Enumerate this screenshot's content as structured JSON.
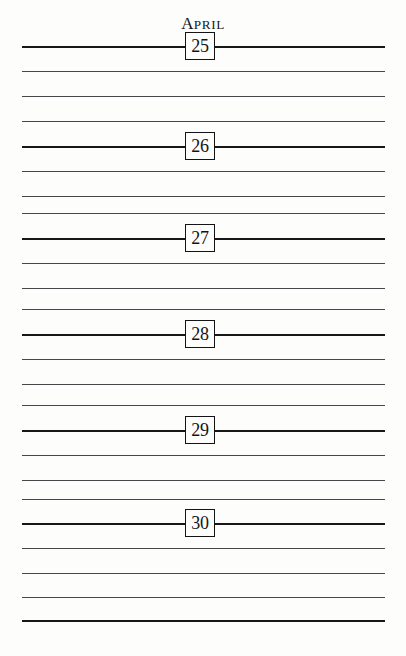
{
  "page": {
    "kind": "printed-diary-page",
    "width": 406,
    "height": 656,
    "background_color": "#fdfdfc",
    "ink_color": "#18181b"
  },
  "header": {
    "month_label": "APRIL",
    "month_first_letter": "A",
    "month_rest_letters": "PRIL",
    "style": "small-caps-serif",
    "center_x": 200,
    "top": 14
  },
  "ruled_lines": {
    "count": 24,
    "left_x": 22,
    "right_x": 385,
    "spacing": 25,
    "first_y": 46,
    "last_y": 620,
    "color": "#2b2b2e",
    "y_positions": [
      46,
      71,
      96,
      121,
      146,
      171,
      196,
      213,
      238,
      263,
      288,
      309,
      334,
      359,
      384,
      405,
      430,
      455,
      480,
      499,
      523,
      548,
      573,
      597,
      620
    ],
    "weights": [
      "strong",
      "soft",
      "soft",
      "soft",
      "strong",
      "soft",
      "soft",
      "soft",
      "strong",
      "soft",
      "soft",
      "soft",
      "strong",
      "soft",
      "soft",
      "soft",
      "strong",
      "soft",
      "soft",
      "soft",
      "strong",
      "soft",
      "soft",
      "soft",
      "strong"
    ]
  },
  "date_boxes": [
    {
      "day": "25",
      "x": 200,
      "y": 46
    },
    {
      "day": "26",
      "x": 200,
      "y": 146
    },
    {
      "day": "27",
      "x": 200,
      "y": 238
    },
    {
      "day": "28",
      "x": 200,
      "y": 334
    },
    {
      "day": "29",
      "x": 200,
      "y": 430
    },
    {
      "day": "30",
      "x": 200,
      "y": 523
    }
  ]
}
